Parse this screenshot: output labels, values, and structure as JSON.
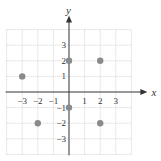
{
  "chart_data": {
    "type": "scatter",
    "title": "",
    "xlabel": "x",
    "ylabel": "y",
    "xlim": [
      -4,
      4
    ],
    "ylim": [
      -4,
      4
    ],
    "grid": true,
    "x_ticks": [
      -3,
      -2,
      -1,
      1,
      2,
      3
    ],
    "y_ticks": [
      3,
      2,
      1,
      -1,
      -2,
      -3
    ],
    "x_tick_labels": [
      "−3",
      "−2",
      "−1",
      "1",
      "2",
      "3"
    ],
    "y_tick_labels": [
      "3",
      "2",
      "1",
      "−1",
      "−2",
      "−3"
    ],
    "points": [
      {
        "x": -3,
        "y": 1
      },
      {
        "x": 0,
        "y": 2
      },
      {
        "x": 2,
        "y": 2
      },
      {
        "x": 0,
        "y": -1
      },
      {
        "x": -2,
        "y": -2
      },
      {
        "x": 2,
        "y": -2
      }
    ],
    "point_color": "#8a8a8a"
  }
}
